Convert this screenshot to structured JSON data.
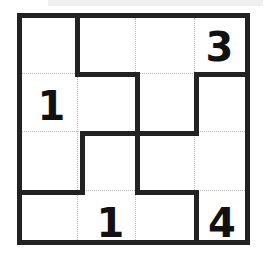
{
  "puzzle": {
    "kind": "number-cage-grid",
    "rows": 4,
    "cols": 4,
    "colors": {
      "background": "#ffffff",
      "border": "#222222",
      "cage_line": "#222222",
      "cell_line": "#b9b9b9",
      "clue_text": "#111111"
    },
    "clues": [
      {
        "id": "clue-r1c4",
        "value": "3",
        "row": 1,
        "col": 4
      },
      {
        "id": "clue-r2c1",
        "value": "1",
        "row": 2,
        "col": 1
      },
      {
        "id": "clue-r4c2",
        "value": "1",
        "row": 4,
        "col": 2
      },
      {
        "id": "clue-r4c4",
        "value": "4",
        "row": 4,
        "col": 4
      }
    ],
    "cells": [
      {
        "id": "cell-r1c1",
        "row": 1,
        "col": 1,
        "value": ""
      },
      {
        "id": "cell-r1c2",
        "row": 1,
        "col": 2,
        "value": ""
      },
      {
        "id": "cell-r1c3",
        "row": 1,
        "col": 3,
        "value": ""
      },
      {
        "id": "cell-r1c4",
        "row": 1,
        "col": 4,
        "value": "3"
      },
      {
        "id": "cell-r2c1",
        "row": 2,
        "col": 1,
        "value": "1"
      },
      {
        "id": "cell-r2c2",
        "row": 2,
        "col": 2,
        "value": ""
      },
      {
        "id": "cell-r2c3",
        "row": 2,
        "col": 3,
        "value": ""
      },
      {
        "id": "cell-r2c4",
        "row": 2,
        "col": 4,
        "value": ""
      },
      {
        "id": "cell-r3c1",
        "row": 3,
        "col": 1,
        "value": ""
      },
      {
        "id": "cell-r3c2",
        "row": 3,
        "col": 2,
        "value": ""
      },
      {
        "id": "cell-r3c3",
        "row": 3,
        "col": 3,
        "value": ""
      },
      {
        "id": "cell-r3c4",
        "row": 3,
        "col": 4,
        "value": ""
      },
      {
        "id": "cell-r4c1",
        "row": 4,
        "col": 1,
        "value": ""
      },
      {
        "id": "cell-r4c2",
        "row": 4,
        "col": 2,
        "value": "1"
      },
      {
        "id": "cell-r4c3",
        "row": 4,
        "col": 3,
        "value": ""
      },
      {
        "id": "cell-r4c4",
        "row": 4,
        "col": 4,
        "value": "4"
      }
    ]
  }
}
